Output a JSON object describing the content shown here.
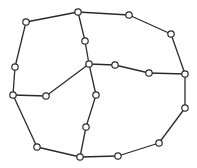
{
  "diagram": {
    "type": "planar-graph",
    "node_radius": 3.2,
    "colors": {
      "stroke": "#2b2b2b",
      "node_fill": "#ffffff",
      "background": "#ffffff"
    },
    "nodes": [
      {
        "id": "A",
        "x": 26,
        "y": 22
      },
      {
        "id": "B",
        "x": 78,
        "y": 12
      },
      {
        "id": "C",
        "x": 129,
        "y": 15
      },
      {
        "id": "D",
        "x": 171,
        "y": 34
      },
      {
        "id": "E",
        "x": 185,
        "y": 74
      },
      {
        "id": "F",
        "x": 185,
        "y": 108
      },
      {
        "id": "G",
        "x": 159,
        "y": 143
      },
      {
        "id": "H",
        "x": 118,
        "y": 156
      },
      {
        "id": "I",
        "x": 80,
        "y": 157
      },
      {
        "id": "J",
        "x": 37,
        "y": 147
      },
      {
        "id": "K",
        "x": 13,
        "y": 95
      },
      {
        "id": "L",
        "x": 15,
        "y": 67
      },
      {
        "id": "M",
        "x": 85,
        "y": 41
      },
      {
        "id": "N",
        "x": 89,
        "y": 64
      },
      {
        "id": "O",
        "x": 115,
        "y": 65
      },
      {
        "id": "P",
        "x": 149,
        "y": 73
      },
      {
        "id": "Q",
        "x": 46,
        "y": 96
      },
      {
        "id": "R",
        "x": 96,
        "y": 95
      },
      {
        "id": "S",
        "x": 86,
        "y": 127
      }
    ],
    "edges": [
      [
        "A",
        "B"
      ],
      [
        "B",
        "C"
      ],
      [
        "C",
        "D"
      ],
      [
        "D",
        "E"
      ],
      [
        "E",
        "F"
      ],
      [
        "F",
        "G"
      ],
      [
        "G",
        "H"
      ],
      [
        "H",
        "I"
      ],
      [
        "I",
        "J"
      ],
      [
        "J",
        "K"
      ],
      [
        "K",
        "L"
      ],
      [
        "L",
        "A"
      ],
      [
        "B",
        "M"
      ],
      [
        "M",
        "N"
      ],
      [
        "N",
        "O"
      ],
      [
        "O",
        "P"
      ],
      [
        "P",
        "E"
      ],
      [
        "N",
        "Q"
      ],
      [
        "Q",
        "K"
      ],
      [
        "N",
        "R"
      ],
      [
        "R",
        "S"
      ],
      [
        "S",
        "I"
      ]
    ]
  }
}
